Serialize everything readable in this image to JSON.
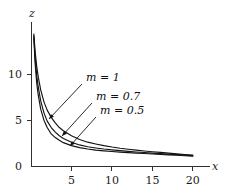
{
  "figure": {
    "background_color": "#ffffff",
    "ink_color": "#121212",
    "axis_color": "#303030"
  },
  "chart_data": {
    "type": "line",
    "title": "",
    "subtitle": "",
    "xlabel": "x",
    "ylabel": "z",
    "xlim": [
      0,
      21.5
    ],
    "ylim": [
      0,
      15.5
    ],
    "xticks": [
      5,
      10,
      15,
      20
    ],
    "xtick_labels": [
      "5",
      "10",
      "15",
      "20"
    ],
    "yticks": [
      0,
      5,
      10
    ],
    "ytick_labels": [
      "0",
      "5",
      "10"
    ],
    "grid": false,
    "legend_position": "inline-annotations",
    "annotations": [
      {
        "label": "m = 1",
        "text_x": 86,
        "text_y": 81,
        "point_x": 49,
        "point_y": 119
      },
      {
        "label": "m = 0.7",
        "text_x": 96,
        "text_y": 100,
        "point_x": 62,
        "point_y": 136
      },
      {
        "label": "m = 0.5",
        "text_x": 100,
        "text_y": 114,
        "point_x": 70,
        "point_y": 146
      }
    ],
    "series": [
      {
        "name": "m = 1",
        "m": 1,
        "x": [
          0.35,
          0.5,
          0.7,
          0.9,
          1.2,
          1.6,
          2,
          2.5,
          3,
          3.5,
          4,
          5,
          6,
          7,
          8,
          9,
          10,
          11,
          12,
          13,
          14,
          15,
          16,
          17,
          18,
          19,
          20
        ],
        "y": [
          14.4,
          12.6,
          10.9,
          9.7,
          8.3,
          7.0,
          6.1,
          5.3,
          4.7,
          4.2,
          3.85,
          3.3,
          2.9,
          2.6,
          2.4,
          2.22,
          2.07,
          1.94,
          1.83,
          1.73,
          1.64,
          1.56,
          1.48,
          1.4,
          1.33,
          1.26,
          1.18
        ]
      },
      {
        "name": "m = 0.7",
        "m": 0.7,
        "x": [
          0.35,
          0.5,
          0.7,
          0.9,
          1.2,
          1.6,
          2,
          2.5,
          3,
          3.5,
          4,
          5,
          6,
          7,
          8,
          9,
          10,
          11,
          12,
          13,
          14,
          15,
          16,
          17,
          18,
          19,
          20
        ],
        "y": [
          14.2,
          11.9,
          9.9,
          8.6,
          7.1,
          5.8,
          4.9,
          4.2,
          3.7,
          3.3,
          3.0,
          2.6,
          2.3,
          2.1,
          1.97,
          1.85,
          1.76,
          1.68,
          1.6,
          1.53,
          1.47,
          1.41,
          1.35,
          1.29,
          1.24,
          1.18,
          1.12
        ]
      },
      {
        "name": "m = 0.5",
        "m": 0.5,
        "x": [
          0.35,
          0.5,
          0.7,
          0.9,
          1.2,
          1.6,
          2,
          2.5,
          3,
          3.5,
          4,
          5,
          6,
          7,
          8,
          9,
          10,
          11,
          12,
          13,
          14,
          15,
          16,
          17,
          18,
          19,
          20
        ],
        "y": [
          14.0,
          11.3,
          9.1,
          7.7,
          6.2,
          5.0,
          4.2,
          3.5,
          3.1,
          2.8,
          2.55,
          2.22,
          2.0,
          1.85,
          1.74,
          1.65,
          1.58,
          1.52,
          1.46,
          1.41,
          1.36,
          1.31,
          1.26,
          1.22,
          1.17,
          1.12,
          1.07
        ]
      }
    ]
  }
}
